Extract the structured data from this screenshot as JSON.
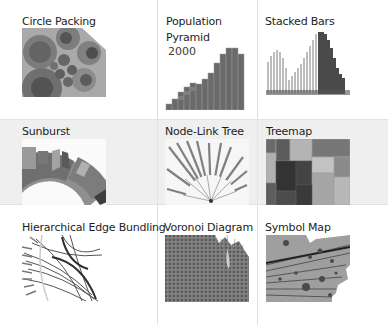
{
  "gallery": {
    "items": [
      {
        "title": "Circle Packing",
        "icon": "circle-packing-thumbnail"
      },
      {
        "title": "Population",
        "title_line2": "Pyramid",
        "year": "2000",
        "icon": "population-pyramid-thumbnail"
      },
      {
        "title": "Stacked Bars",
        "icon": "stacked-bars-thumbnail"
      },
      {
        "title": "Sunburst",
        "icon": "sunburst-thumbnail"
      },
      {
        "title": "Node-Link Tree",
        "icon": "node-link-tree-thumbnail"
      },
      {
        "title": "Treemap",
        "icon": "treemap-thumbnail"
      },
      {
        "title": "Hierarchical Edge Bundling",
        "icon": "edge-bundling-thumbnail"
      },
      {
        "title": "Voronoi Diagram",
        "icon": "voronoi-thumbnail"
      },
      {
        "title": "Symbol Map",
        "icon": "symbol-map-thumbnail"
      }
    ],
    "colors": {
      "highlight_row": "#efefef",
      "divider": "#dedede",
      "thumb_dark": "#555555",
      "thumb_mid": "#8a8a8a",
      "thumb_light": "#b5b5b5"
    }
  }
}
